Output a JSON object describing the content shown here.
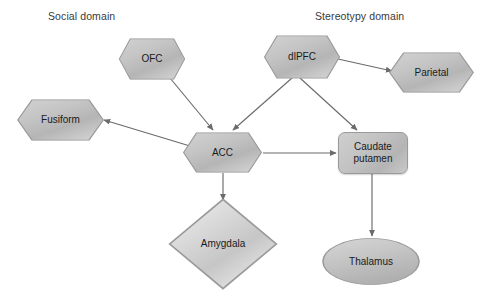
{
  "diagram": {
    "background_color": "#ffffff",
    "node_fill_color": "#c3c3c3",
    "node_border_color": "#9a9a9a",
    "edge_color": "#6b6b6b",
    "text_color": "#1a1a1a",
    "label_color": "#3a3a3a",
    "labels": [
      {
        "id": "social-domain",
        "text": "Social domain",
        "x": 48,
        "y": 10
      },
      {
        "id": "stereotypy-domain",
        "text": "Stereotypy domain",
        "x": 315,
        "y": 10
      }
    ],
    "nodes": [
      {
        "id": "ofc",
        "label": "OFC",
        "shape": "hexagon",
        "x": 118,
        "y": 38,
        "w": 68,
        "h": 42
      },
      {
        "id": "dlpfc",
        "label": "dlPFC",
        "shape": "hexagon",
        "x": 263,
        "y": 35,
        "w": 78,
        "h": 44
      },
      {
        "id": "parietal",
        "label": "Parietal",
        "shape": "hexagon",
        "x": 388,
        "y": 52,
        "w": 87,
        "h": 41
      },
      {
        "id": "fusiform",
        "label": "Fusiform",
        "shape": "hexagon",
        "x": 16,
        "y": 99,
        "w": 89,
        "h": 42
      },
      {
        "id": "acc",
        "label": "ACC",
        "shape": "hexagon",
        "x": 182,
        "y": 132,
        "w": 81,
        "h": 41
      },
      {
        "id": "caudate-putamen",
        "label": "Caudate\nputamen",
        "shape": "rounded-rect",
        "x": 338,
        "y": 132,
        "w": 70,
        "h": 42
      },
      {
        "id": "amygdala",
        "label": "Amygdala",
        "shape": "diamond",
        "x": 168,
        "y": 198,
        "w": 110,
        "h": 92
      },
      {
        "id": "thalamus",
        "label": "Thalamus",
        "shape": "ellipse",
        "x": 322,
        "y": 238,
        "w": 98,
        "h": 47
      }
    ],
    "edges": [
      {
        "id": "ofc-to-acc",
        "from": "ofc",
        "to": "acc",
        "arrow": "to",
        "x1": 170,
        "y1": 78,
        "x2": 213,
        "y2": 130
      },
      {
        "id": "dlpfc-to-acc",
        "from": "dlpfc",
        "to": "acc",
        "arrow": "to",
        "x1": 292,
        "y1": 78,
        "x2": 233,
        "y2": 130
      },
      {
        "id": "dlpfc-to-parietal",
        "from": "dlpfc",
        "to": "parietal",
        "arrow": "to",
        "x1": 338,
        "y1": 59,
        "x2": 392,
        "y2": 71
      },
      {
        "id": "dlpfc-to-caudate",
        "from": "dlpfc",
        "to": "caudate-putamen",
        "arrow": "to",
        "x1": 300,
        "y1": 78,
        "x2": 357,
        "y2": 130
      },
      {
        "id": "acc-to-fusiform",
        "from": "acc",
        "to": "fusiform",
        "arrow": "to",
        "x1": 190,
        "y1": 146,
        "x2": 104,
        "y2": 120
      },
      {
        "id": "acc-to-caudate",
        "from": "acc",
        "to": "caudate-putamen",
        "arrow": "to",
        "x1": 263,
        "y1": 153,
        "x2": 336,
        "y2": 153
      },
      {
        "id": "acc-to-amygdala",
        "from": "acc",
        "to": "amygdala",
        "arrow": "to",
        "x1": 223,
        "y1": 173,
        "x2": 223,
        "y2": 200
      },
      {
        "id": "caudate-to-thalamus",
        "from": "caudate-putamen",
        "to": "thalamus",
        "arrow": "to",
        "x1": 372,
        "y1": 174,
        "x2": 372,
        "y2": 236
      }
    ]
  }
}
